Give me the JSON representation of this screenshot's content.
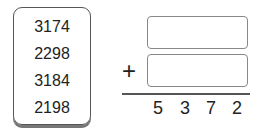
{
  "numbers": [
    "3174",
    "2298",
    "3184",
    "2198"
  ],
  "problem": {
    "operator": "+",
    "blank_1": "",
    "blank_2": "",
    "sum_digits": [
      "5",
      "3",
      "7",
      "2"
    ]
  }
}
